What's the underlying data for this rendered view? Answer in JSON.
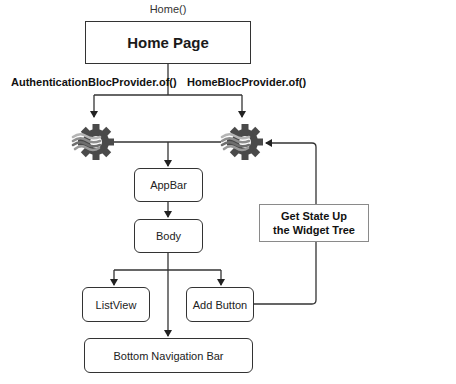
{
  "diagram": {
    "top_caption": "Home()",
    "root": {
      "label": "Home Page"
    },
    "edge_labels": {
      "left": "AuthenticationBlocProvider.of()",
      "right": "HomeBlocProvider.of()"
    },
    "icons": {
      "left": "bloc-gear-icon",
      "right": "bloc-gear-icon"
    },
    "nodes": {
      "appbar": "AppBar",
      "body": "Body",
      "listview": "ListView",
      "add_button": "Add Button",
      "bottom_nav": "Bottom Navigation Bar"
    },
    "note": {
      "line1": "Get State Up",
      "line2": "the Widget Tree"
    },
    "colors": {
      "line": "#333333",
      "gear": "#4a4a4a",
      "wave_dark": "#6e6e6e",
      "wave_light": "#b5b5b5",
      "note_border": "#8a8a8a"
    }
  }
}
